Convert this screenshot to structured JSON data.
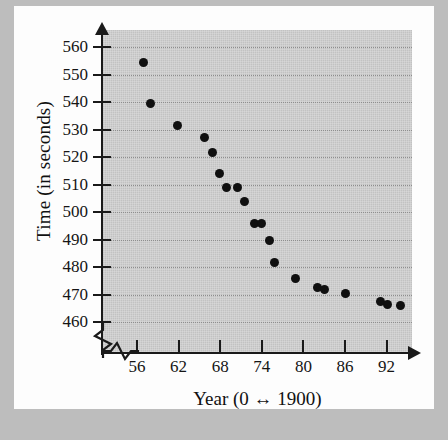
{
  "chart_data": {
    "type": "scatter",
    "title": "",
    "xlabel": "Year (0 ↔ 1900)",
    "ylabel": "Time (in seconds)",
    "xlim": [
      53,
      95
    ],
    "ylim": [
      455,
      565
    ],
    "xticks": [
      56,
      62,
      68,
      74,
      80,
      86,
      92
    ],
    "xtick_labels": [
      "56",
      "62",
      "68",
      "74",
      "80",
      "86",
      "92"
    ],
    "yticks": [
      460,
      470,
      480,
      490,
      500,
      510,
      520,
      530,
      540,
      550,
      560
    ],
    "ytick_labels": [
      "460",
      "470",
      "480",
      "490",
      "500",
      "510",
      "520",
      "530",
      "540",
      "550",
      "560"
    ],
    "grid": "horizontal-dotted",
    "legend": "none",
    "axis_break_x": true,
    "axis_break_y": true,
    "marker_color": "#101010",
    "panel_color": "#cbcbcb",
    "points": [
      {
        "x": 56.9,
        "y": 554.5
      },
      {
        "x": 58.0,
        "y": 539.5
      },
      {
        "x": 61.9,
        "y": 531.5
      },
      {
        "x": 65.8,
        "y": 527.0
      },
      {
        "x": 66.9,
        "y": 521.5
      },
      {
        "x": 67.9,
        "y": 514.0
      },
      {
        "x": 68.9,
        "y": 509.0
      },
      {
        "x": 70.5,
        "y": 509.0
      },
      {
        "x": 71.5,
        "y": 504.0
      },
      {
        "x": 72.9,
        "y": 496.0
      },
      {
        "x": 73.9,
        "y": 496.0
      },
      {
        "x": 75.1,
        "y": 489.5
      },
      {
        "x": 75.9,
        "y": 481.5
      },
      {
        "x": 78.9,
        "y": 476.0
      },
      {
        "x": 82.1,
        "y": 472.5
      },
      {
        "x": 83.1,
        "y": 472.0
      },
      {
        "x": 86.0,
        "y": 470.5
      },
      {
        "x": 91.1,
        "y": 467.5
      },
      {
        "x": 92.2,
        "y": 466.5
      },
      {
        "x": 94.0,
        "y": 466.0
      }
    ]
  }
}
